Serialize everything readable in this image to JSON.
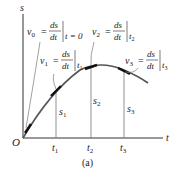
{
  "diagram": {
    "axes": {
      "vertical_label": "s",
      "horizontal_label": "t",
      "origin_label": "O"
    },
    "ticks": [
      {
        "label": "t",
        "sub": "1"
      },
      {
        "label": "t",
        "sub": "2"
      },
      {
        "label": "t",
        "sub": "3"
      }
    ],
    "heights": [
      {
        "label": "s",
        "sub": "1"
      },
      {
        "label": "s",
        "sub": "2"
      },
      {
        "label": "s",
        "sub": "3"
      }
    ],
    "velocity_labels": [
      {
        "v": "v",
        "vsub": "0",
        "eq": "=",
        "num": "ds",
        "den": "dt",
        "at": "t = 0"
      },
      {
        "v": "v",
        "vsub": "1",
        "eq": "=",
        "num": "ds",
        "den": "dt",
        "at": "t",
        "atsub": "1"
      },
      {
        "v": "v",
        "vsub": "2",
        "eq": "=",
        "num": "ds",
        "den": "dt",
        "at": "t",
        "atsub": "2"
      },
      {
        "v": "v",
        "vsub": "3",
        "eq": "=",
        "num": "ds",
        "den": "dt",
        "at": "t",
        "atsub": "3"
      }
    ],
    "caption": "(a)",
    "colors": {
      "curve": "#555555",
      "axis": "#333333",
      "tangent": "#111111",
      "guide": "#777777"
    }
  }
}
